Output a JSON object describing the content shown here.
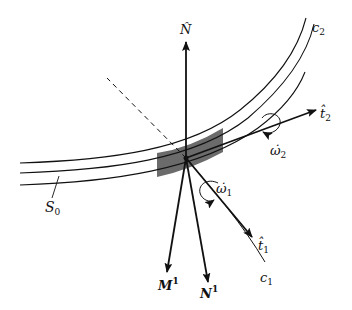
{
  "diagram": {
    "type": "geometric-vector-diagram",
    "labels": {
      "N_hat": "N̂",
      "t2_hat": "t̂",
      "t2_sub": "2",
      "omega2": "ω̇",
      "omega2_sub": "2",
      "omega1": "ω̇",
      "omega1_sub": "1",
      "t1_hat": "t̂",
      "t1_sub": "1",
      "M1": "M",
      "M1_sup": "1",
      "N1": "N",
      "N1_sup": "1",
      "c1": "c",
      "c1_sub": "1",
      "c2": "c",
      "c2_sub": "2",
      "S0": "S",
      "S0_sub": "0"
    },
    "colors": {
      "stroke": "#111111",
      "shaded_band": "#6b6b6b",
      "background": "#ffffff"
    }
  }
}
